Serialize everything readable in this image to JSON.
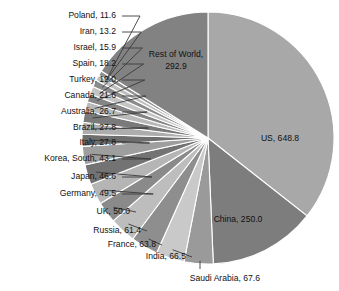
{
  "chart_data": {
    "type": "pie",
    "title": "",
    "total": 2000.0,
    "legend_position": "none",
    "grid": false,
    "labels": [
      "US",
      "China",
      "Saudi Arabia",
      "India",
      "France",
      "Russia",
      "UK",
      "Germany",
      "Japan",
      "Korea, South",
      "Italy",
      "Brazil",
      "Australia",
      "Canada",
      "Turkey",
      "Spain",
      "Israel",
      "Iran",
      "Poland",
      "Rest of World"
    ],
    "values": [
      648.8,
      250.0,
      67.6,
      66.5,
      63.8,
      61.4,
      50.0,
      49.5,
      46.6,
      43.1,
      27.8,
      27.8,
      26.7,
      21.6,
      19.0,
      18.2,
      15.9,
      13.2,
      11.6,
      292.9
    ],
    "slices": [
      {
        "label": "US",
        "value": 648.8,
        "text": "US, 648.8",
        "color": "#a8a8a8",
        "placement": "inside"
      },
      {
        "label": "China",
        "value": 250.0,
        "text": "China, 250.0",
        "color": "#7d7d7d",
        "placement": "inside"
      },
      {
        "label": "Saudi Arabia",
        "value": 67.6,
        "text": "Saudi Arabia, 67.6",
        "color": "#9a9a9a",
        "placement": "callout-bottom"
      },
      {
        "label": "India",
        "value": 66.5,
        "text": "India, 66.5",
        "color": "#c9c9c9",
        "placement": "callout-left"
      },
      {
        "label": "France",
        "value": 63.8,
        "text": "France, 63.8",
        "color": "#8e8e8e",
        "placement": "callout-left"
      },
      {
        "label": "Russia",
        "value": 61.4,
        "text": "Russia, 61.4",
        "color": "#bdbdbd",
        "placement": "callout-left"
      },
      {
        "label": "UK",
        "value": 50.0,
        "text": "UK, 50.0",
        "color": "#8a8a8a",
        "placement": "callout-left"
      },
      {
        "label": "Germany",
        "value": 49.5,
        "text": "Germany, 49.5",
        "color": "#b5b5b5",
        "placement": "callout-left"
      },
      {
        "label": "Japan",
        "value": 46.6,
        "text": "Japan, 46.6",
        "color": "#737373",
        "placement": "callout-left"
      },
      {
        "label": "Korea, South",
        "value": 43.1,
        "text": "Korea, South, 43.1",
        "color": "#9e9e9e",
        "placement": "callout-left"
      },
      {
        "label": "Italy",
        "value": 27.8,
        "text": "Italy, 27.8",
        "color": "#6e6e6e",
        "placement": "callout-left"
      },
      {
        "label": "Brazil",
        "value": 27.8,
        "text": "Brazil, 27.8",
        "color": "#adadad",
        "placement": "callout-left"
      },
      {
        "label": "Australia",
        "value": 26.7,
        "text": "Australia, 26.7",
        "color": "#7a7a7a",
        "placement": "callout-left"
      },
      {
        "label": "Canada",
        "value": 21.6,
        "text": "Canada, 21.6",
        "color": "#b9b9b9",
        "placement": "callout-left"
      },
      {
        "label": "Turkey",
        "value": 19.0,
        "text": "Turkey, 19.0",
        "color": "#858585",
        "placement": "callout-left"
      },
      {
        "label": "Spain",
        "value": 18.2,
        "text": "Spain, 18.2",
        "color": "#c4c4c4",
        "placement": "callout-left"
      },
      {
        "label": "Israel",
        "value": 15.9,
        "text": "Israel, 15.9",
        "color": "#8b8b8b",
        "placement": "callout-left"
      },
      {
        "label": "Iran",
        "value": 13.2,
        "text": "Iran, 13.2",
        "color": "#bfbfbf",
        "placement": "callout-left"
      },
      {
        "label": "Poland",
        "value": 11.6,
        "text": "Poland, 11.6",
        "color": "#909090",
        "placement": "callout-left"
      },
      {
        "label": "Rest of World",
        "value": 292.9,
        "text": "Rest of World, 292.9",
        "color": "#828282",
        "placement": "inside-two-line",
        "line1": "Rest of World,",
        "line2": "292.9"
      }
    ],
    "geometry": {
      "cx": 208,
      "cy": 138,
      "r": 126,
      "start_angle_deg": -90
    },
    "callout_labels": [
      {
        "text": "Poland, 11.6",
        "x": 116,
        "y": 16
      },
      {
        "text": "Iran, 13.2",
        "x": 116,
        "y": 32
      },
      {
        "text": "Israel, 15.9",
        "x": 116,
        "y": 48
      },
      {
        "text": "Spain, 18.2",
        "x": 116,
        "y": 64
      },
      {
        "text": "Turkey, 19.0",
        "x": 116,
        "y": 80
      },
      {
        "text": "Canada, 21.6",
        "x": 116,
        "y": 96
      },
      {
        "text": "Australia, 26.7",
        "x": 116,
        "y": 112
      },
      {
        "text": "Brazil, 27.8",
        "x": 116,
        "y": 128
      },
      {
        "text": "Italy, 27.8",
        "x": 116,
        "y": 143
      },
      {
        "text": "Korea, South, 43.1",
        "x": 116,
        "y": 159
      },
      {
        "text": "Japan, 46.6",
        "x": 116,
        "y": 177
      },
      {
        "text": "Germany, 49.5",
        "x": 116,
        "y": 194
      },
      {
        "text": "UK, 50.0",
        "x": 130,
        "y": 212
      },
      {
        "text": "Russia, 61.4",
        "x": 141,
        "y": 231
      },
      {
        "text": "France, 63.8",
        "x": 156,
        "y": 245
      },
      {
        "text": "India, 66.5",
        "x": 186,
        "y": 257
      },
      {
        "text": "Saudi Arabia, 67.6",
        "x": 260,
        "y": 279
      }
    ],
    "inside_labels": [
      {
        "text": "US, 648.8",
        "x": 280,
        "y": 139
      },
      {
        "text": "China, 250.0",
        "x": 238,
        "y": 220
      },
      {
        "text": "Rest of World,",
        "x": 176,
        "y": 55
      },
      {
        "text": "292.9",
        "x": 176,
        "y": 67
      }
    ]
  }
}
